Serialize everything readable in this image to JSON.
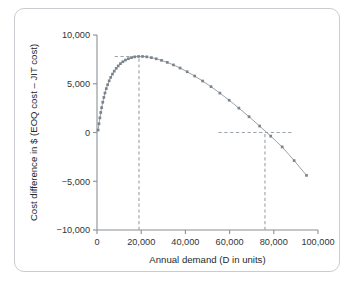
{
  "figure": {
    "panel_border_color": "#c9cdd1",
    "background": "#ffffff"
  },
  "chart_data": {
    "type": "line",
    "title": "",
    "xlabel": "Annual demand (D in units)",
    "ylabel": "Cost difference in $ (EOQ cost – JIT cost)",
    "xlim": [
      0,
      100000
    ],
    "ylim": [
      -10000,
      10000
    ],
    "grid": false,
    "legend": "none",
    "line_color": "#9aa2ab",
    "marker_color": "#7b848d",
    "marker_shape": "square",
    "xticks": [
      0,
      20000,
      40000,
      60000,
      80000,
      100000
    ],
    "xticklabels": [
      "0",
      "20,000",
      "40,000",
      "60,000",
      "80,000",
      "100,000"
    ],
    "yticks": [
      -10000,
      -5000,
      0,
      5000,
      10000
    ],
    "yticklabels": [
      "−10,000",
      "−5,000",
      "0",
      "5,000",
      "10,000"
    ],
    "x": [
      500,
      900,
      1300,
      1700,
      2100,
      2600,
      3100,
      3600,
      4200,
      4800,
      5500,
      6200,
      7000,
      7800,
      8700,
      9600,
      10600,
      11700,
      12900,
      14200,
      15600,
      17100,
      18800,
      20600,
      22500,
      24600,
      26800,
      29200,
      31800,
      34600,
      37600,
      40800,
      44200,
      47800,
      51600,
      55600,
      59800,
      64200,
      68800,
      73600,
      78600,
      83800,
      89200,
      94800
    ],
    "y": [
      250,
      900,
      1500,
      2050,
      2550,
      3100,
      3600,
      4050,
      4500,
      4900,
      5300,
      5650,
      5990,
      6290,
      6580,
      6830,
      7060,
      7260,
      7430,
      7570,
      7680,
      7760,
      7800,
      7800,
      7760,
      7680,
      7560,
      7400,
      7190,
      6930,
      6610,
      6230,
      5790,
      5280,
      4700,
      4040,
      3310,
      2500,
      1620,
      660,
      -370,
      -1480,
      -2880,
      -4400
    ],
    "annotations": [
      {
        "name": "peak-horizontal-guide",
        "type": "hline",
        "y": 7800,
        "x_from": 8000,
        "x_to": 23500
      },
      {
        "name": "peak-vertical-guide",
        "type": "vline",
        "x": 19000,
        "y_from": -10000,
        "y_to": 7800
      },
      {
        "name": "breakeven-horizontal-guide",
        "type": "hline",
        "y": 0,
        "x_from": 55000,
        "x_to": 88000
      },
      {
        "name": "breakeven-vertical-guide",
        "type": "vline",
        "x": 76000,
        "y_from": -10000,
        "y_to": 0
      }
    ]
  }
}
